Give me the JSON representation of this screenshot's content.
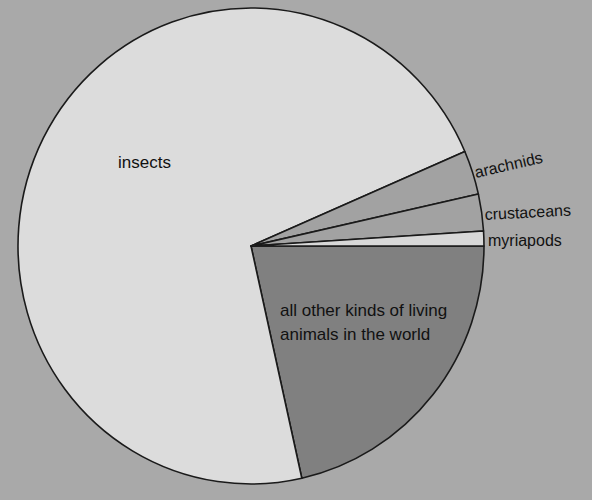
{
  "chart_data": {
    "type": "pie",
    "title": "",
    "unit": "approximate share of known animal species",
    "slices": [
      {
        "label": "all other kinds of living animals in the world",
        "label_lines": [
          "all other kinds of living",
          "animals in the world"
        ],
        "value": 21.5,
        "color": "#808080"
      },
      {
        "label": "insects",
        "value": 72.0,
        "color": "#dcdcdc"
      },
      {
        "label": "arachnids",
        "value": 3.0,
        "color": "#a2a2a2"
      },
      {
        "label": "crustaceans",
        "value": 2.5,
        "color": "#a2a2a2"
      },
      {
        "label": "myriapods",
        "value": 1.0,
        "color": "#d8d8d8"
      }
    ],
    "start_angle_deg": 0,
    "direction": "clockwise",
    "legend": "none (labels placed directly)",
    "background_color": "#a9a9a9"
  },
  "labels": {
    "insects": "insects",
    "arachnids": "arachnids",
    "crustaceans": "crustaceans",
    "myriapods": "myriapods",
    "other_line1": "all other kinds of living",
    "other_line2": "animals in the world"
  }
}
